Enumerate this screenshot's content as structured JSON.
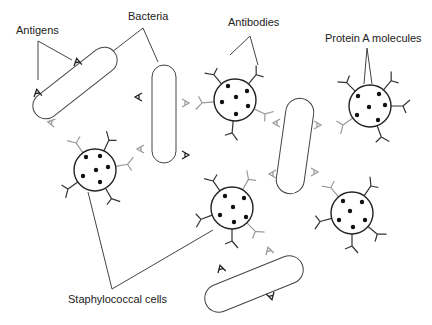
{
  "diagram": {
    "labels": {
      "antigens": "Antigens",
      "bacteria": "Bacteria",
      "antibodies": "Antibodies",
      "protein_a": "Protein A molecules",
      "staph_cells": "Staphylococcal cells"
    },
    "colors": {
      "outline": "#333333",
      "antibody_bound": "#9a9a9a",
      "antibody_free": "#333333",
      "dot": "#111111"
    },
    "counts": {
      "bacteria": 5,
      "staphylococcal_cells": 5
    }
  }
}
